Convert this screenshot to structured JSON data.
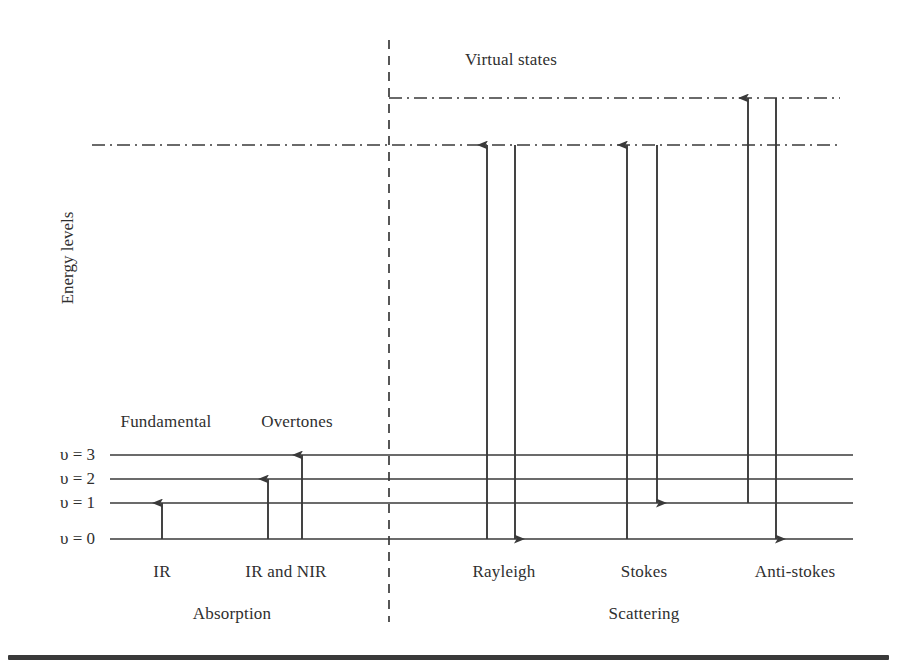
{
  "figure": {
    "title_region_label": "Virtual states",
    "y_axis_label": "Energy levels",
    "background_color": "#ffffff",
    "line_color": "#3a3a3a",
    "text_color": "#2f2f2f"
  },
  "vibrational_levels": [
    {
      "id": "v3",
      "label": "υ = 3",
      "y": 455
    },
    {
      "id": "v2",
      "label": "υ = 2",
      "y": 479
    },
    {
      "id": "v1",
      "label": "υ = 1",
      "y": 503
    },
    {
      "id": "v0",
      "label": "υ = 0",
      "y": 539
    }
  ],
  "virtual_states": [
    {
      "id": "virtual-upper",
      "y": 98,
      "x_start": 389,
      "x_end": 840,
      "style": "dash-dot"
    },
    {
      "id": "virtual-lower",
      "y": 145,
      "x_start": 92,
      "x_end": 840,
      "style": "dash-dot"
    }
  ],
  "divider": {
    "id": "absorption-scattering-divider",
    "x": 389,
    "y_start": 40,
    "y_end": 622,
    "style": "dashed"
  },
  "transitions": [
    {
      "id": "ir-fundamental",
      "x": 162,
      "from_y": 539,
      "to_y": 503,
      "direction": "up"
    },
    {
      "id": "overtone-v2",
      "x": 268,
      "from_y": 539,
      "to_y": 479,
      "direction": "up"
    },
    {
      "id": "overtone-v3",
      "x": 302,
      "from_y": 539,
      "to_y": 455,
      "direction": "up"
    },
    {
      "id": "rayleigh-excite",
      "x": 487,
      "from_y": 539,
      "to_y": 145,
      "direction": "up"
    },
    {
      "id": "rayleigh-emit",
      "x": 515,
      "from_y": 145,
      "to_y": 539,
      "direction": "down"
    },
    {
      "id": "stokes-excite",
      "x": 627,
      "from_y": 539,
      "to_y": 145,
      "direction": "up"
    },
    {
      "id": "stokes-emit",
      "x": 657,
      "from_y": 145,
      "to_y": 503,
      "direction": "down"
    },
    {
      "id": "antistokes-excite",
      "x": 748,
      "from_y": 503,
      "to_y": 98,
      "direction": "up"
    },
    {
      "id": "antistokes-emit",
      "x": 776,
      "from_y": 98,
      "to_y": 539,
      "direction": "down"
    }
  ],
  "annotations": {
    "fundamental": {
      "text": "Fundamental",
      "x": 166,
      "y": 413
    },
    "overtones": {
      "text": "Overtones",
      "x": 297,
      "y": 413
    },
    "virtual_states": {
      "text": "Virtual states",
      "x": 511,
      "y": 51
    }
  },
  "process_labels": [
    {
      "id": "ir",
      "text": "IR",
      "x": 162,
      "y": 563
    },
    {
      "id": "ir-and-nir",
      "text": "IR and NIR",
      "x": 286,
      "y": 563
    },
    {
      "id": "rayleigh",
      "text": "Rayleigh",
      "x": 504,
      "y": 563
    },
    {
      "id": "stokes",
      "text": "Stokes",
      "x": 644,
      "y": 563
    },
    {
      "id": "anti-stokes",
      "text": "Anti-stokes",
      "x": 795,
      "y": 563
    }
  ],
  "group_labels": [
    {
      "id": "absorption",
      "text": "Absorption",
      "x": 232,
      "y": 605
    },
    {
      "id": "scattering",
      "text": "Scattering",
      "x": 644,
      "y": 605
    }
  ],
  "level_line_extent": {
    "x_start": 110,
    "x_end": 853
  },
  "chart_data": {
    "type": "diagram",
    "ylabel": "Energy levels",
    "ground_state_levels": [
      "υ = 0",
      "υ = 1",
      "υ = 2",
      "υ = 3"
    ],
    "virtual_state_count": 2,
    "processes": [
      {
        "name": "IR",
        "group": "Absorption",
        "type": "Fundamental",
        "start_level": "υ = 0",
        "end_level": "υ = 1"
      },
      {
        "name": "IR and NIR",
        "group": "Absorption",
        "type": "Overtones",
        "start_level": "υ = 0",
        "end_level": "υ = 2 and υ = 3"
      },
      {
        "name": "Rayleigh",
        "group": "Scattering",
        "start_level": "υ = 0",
        "virtual_state": "lower",
        "end_level": "υ = 0"
      },
      {
        "name": "Stokes",
        "group": "Scattering",
        "start_level": "υ = 0",
        "virtual_state": "lower",
        "end_level": "υ = 1"
      },
      {
        "name": "Anti-stokes",
        "group": "Scattering",
        "start_level": "υ = 1",
        "virtual_state": "upper",
        "end_level": "υ = 0"
      }
    ]
  }
}
